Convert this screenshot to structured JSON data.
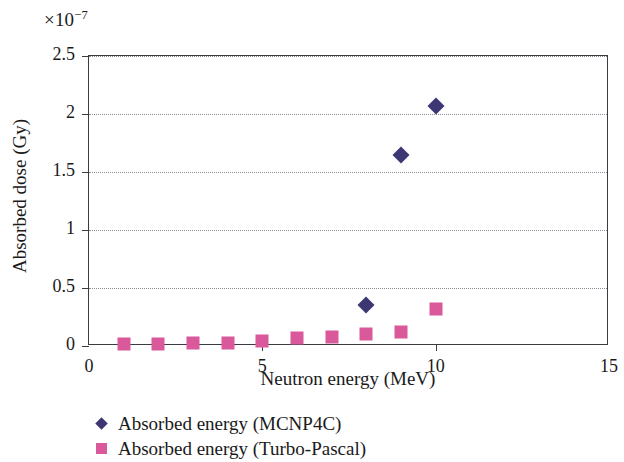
{
  "chart_data": {
    "type": "scatter",
    "title": "",
    "xlabel": "Neutron energy (MeV)",
    "ylabel": "Absorbed dose (Gy)",
    "y_multiplier": "×10",
    "y_multiplier_exponent": "−7",
    "xlim": [
      0,
      15
    ],
    "ylim": [
      0,
      2.5
    ],
    "xticks": [
      "0",
      "5",
      "10",
      "15"
    ],
    "xtick_values": [
      0,
      5,
      10,
      15
    ],
    "yticks": [
      "0",
      "0.5",
      "1",
      "1.5",
      "2",
      "2.5"
    ],
    "ytick_values": [
      0,
      0.5,
      1,
      1.5,
      2,
      2.5
    ],
    "grid": "horizontal-dotted",
    "legend_position": "below-axes-left",
    "series": [
      {
        "name": "Absorbed energy (MCNP4C)",
        "marker": "diamond",
        "color": "#3c3673",
        "x": [
          8,
          9,
          10
        ],
        "values": [
          0.35,
          1.65,
          2.07
        ]
      },
      {
        "name": "Absorbed energy (Turbo-Pascal)",
        "marker": "square",
        "color": "#d9599a",
        "x": [
          1,
          2,
          3,
          4,
          5,
          6,
          7,
          8,
          9,
          10
        ],
        "values": [
          0.015,
          0.018,
          0.022,
          0.028,
          0.045,
          0.065,
          0.08,
          0.105,
          0.125,
          0.32
        ]
      }
    ]
  },
  "legend": {
    "items": [
      {
        "label": "Absorbed energy (MCNP4C)",
        "marker": "diamond"
      },
      {
        "label": "Absorbed energy (Turbo-Pascal)",
        "marker": "square"
      }
    ]
  }
}
